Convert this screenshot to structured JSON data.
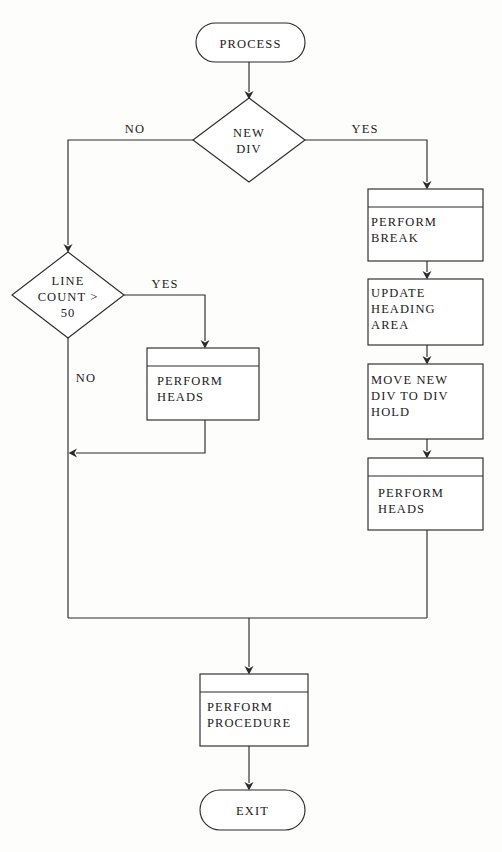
{
  "diagram": {
    "background_color": "#fdfdfc",
    "line_color": "#2b2b2b",
    "text_color": "#1b1b1b",
    "nodes": {
      "start": {
        "label": "PROCESS",
        "shape": "terminator"
      },
      "new_div": {
        "label_line1": "NEW",
        "label_line2": "DIV",
        "shape": "decision"
      },
      "line_count": {
        "label_line1": "LINE",
        "label_line2": "COUNT >",
        "label_line3": "50",
        "shape": "decision"
      },
      "perform_break": {
        "label_line1": "PERFORM",
        "label_line2": "BREAK",
        "shape": "predefined-process"
      },
      "update_heading": {
        "label_line1": "UPDATE",
        "label_line2": "HEADING",
        "label_line3": "AREA",
        "shape": "process"
      },
      "move_new_div": {
        "label_line1": "MOVE NEW",
        "label_line2": "DIV TO DIV",
        "label_line3": "HOLD",
        "shape": "process"
      },
      "perform_heads_right": {
        "label_line1": "PERFORM",
        "label_line2": "HEADS",
        "shape": "predefined-process"
      },
      "perform_heads_left": {
        "label_line1": "PERFORM",
        "label_line2": "HEADS",
        "shape": "predefined-process"
      },
      "perform_procedure": {
        "label_line1": "PERFORM",
        "label_line2": "PROCEDURE",
        "shape": "predefined-process"
      },
      "exit": {
        "label": "EXIT",
        "shape": "terminator"
      }
    },
    "edge_labels": {
      "new_div_no": "NO",
      "new_div_yes": "YES",
      "line_count_yes": "YES",
      "line_count_no": "NO"
    }
  }
}
